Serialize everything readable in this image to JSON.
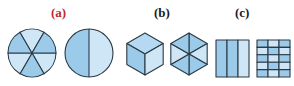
{
  "labels": {
    "a": "(a)",
    "b": "(b)",
    "c": "(c)"
  },
  "colors": {
    "label_a": "#c0292b",
    "label_bc": "#1a1a1a",
    "fill_dark": "#9ccbea",
    "fill_light": "#cfe6f6",
    "fill_mid": "#b5d9f1",
    "stroke": "#2b3a46"
  },
  "groups": [
    {
      "label": "(a)",
      "shapes": [
        {
          "kind": "circle",
          "divisions": 6,
          "division_style": "sectors"
        },
        {
          "kind": "circle",
          "divisions": 2,
          "division_style": "halves"
        }
      ]
    },
    {
      "label": "(b)",
      "shapes": [
        {
          "kind": "hexagon",
          "divisions": 3,
          "division_style": "rhombi"
        },
        {
          "kind": "hexagon",
          "divisions": 6,
          "division_style": "triangles"
        }
      ]
    },
    {
      "label": "(c)",
      "shapes": [
        {
          "kind": "rectangle",
          "columns": 3,
          "rows": 1
        },
        {
          "kind": "rectangle",
          "columns": 3,
          "rows": 5
        }
      ]
    }
  ]
}
